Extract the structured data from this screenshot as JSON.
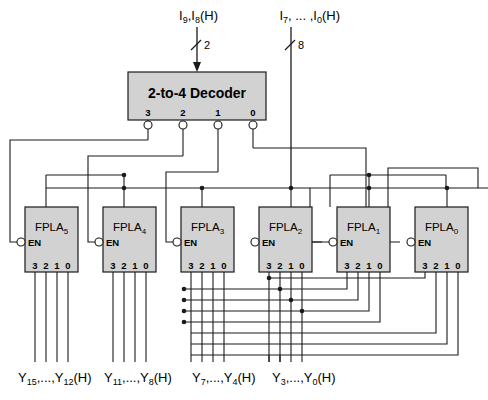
{
  "diagram": {
    "inputs": [
      {
        "name": "decoder-input-label",
        "base": "I",
        "sub1": "9",
        "mid": ",I",
        "sub2": "8",
        "suffix": "(H)",
        "bus_width": "2",
        "x": 218
      },
      {
        "name": "data-input-label",
        "base": "I",
        "sub1": "7",
        "mid": ", ... ,I",
        "sub2": "0",
        "suffix": "(H)",
        "bus_width": "8",
        "x": 299
      }
    ],
    "decoder": {
      "label": "2-to-4 Decoder",
      "x": 128,
      "y": 72,
      "width": 138,
      "height": 48,
      "outputs": [
        "3",
        "2",
        "1",
        "0"
      ]
    },
    "fpla_label_base": "FPLA",
    "en_label": "EN",
    "pin_labels": [
      "3",
      "2",
      "1",
      "0"
    ],
    "blocks": [
      {
        "name": "fpla-5",
        "sub": "5",
        "x": 25,
        "y": 207,
        "width": 53,
        "height": 65
      },
      {
        "name": "fpla-4",
        "sub": "4",
        "x": 103,
        "y": 207,
        "width": 53,
        "height": 65
      },
      {
        "name": "fpla-3",
        "sub": "3",
        "x": 181,
        "y": 207,
        "width": 53,
        "height": 65
      },
      {
        "name": "fpla-2",
        "sub": "2",
        "x": 259,
        "y": 207,
        "width": 53,
        "height": 65
      },
      {
        "name": "fpla-1",
        "sub": "1",
        "x": 337,
        "y": 207,
        "width": 53,
        "height": 65
      },
      {
        "name": "fpla-0",
        "sub": "0",
        "x": 415,
        "y": 207,
        "width": 53,
        "height": 65
      }
    ],
    "outputs": [
      {
        "name": "output-y15-y12",
        "base": "Y",
        "sub1": "15",
        "mid": ",...,Y",
        "sub2": "12",
        "suffix": "(H)",
        "x": 18
      },
      {
        "name": "output-y11-y8",
        "base": "Y",
        "sub1": "11",
        "mid": ",...,Y",
        "sub2": "8",
        "suffix": "(H)",
        "x": 104
      },
      {
        "name": "output-y7-y4",
        "base": "Y",
        "sub1": "7",
        "mid": ",...,Y",
        "sub2": "4",
        "suffix": "(H)",
        "x": 192
      },
      {
        "name": "output-y3-y0",
        "base": "Y",
        "sub1": "3",
        "mid": ",...,Y",
        "sub2": "0",
        "suffix": "(H)",
        "x": 272
      }
    ],
    "colors": {
      "block_fill": "#d2d2d2",
      "wire": "#1a1a1a",
      "background": "#ffffff"
    }
  }
}
